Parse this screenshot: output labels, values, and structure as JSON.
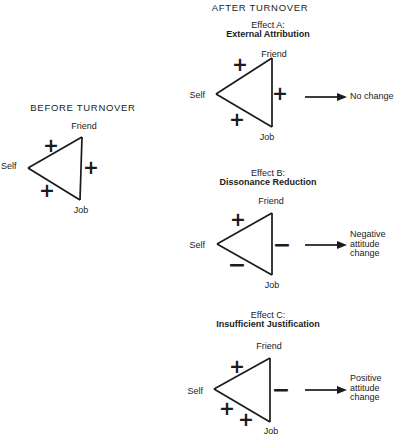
{
  "figure": {
    "before": {
      "title": "BEFORE TURNOVER",
      "nodes": {
        "left": "Self",
        "top": "Friend",
        "bottom": "Job"
      },
      "signs": {
        "self_friend": "+",
        "friend_job": "+",
        "self_job": "+"
      }
    },
    "after": {
      "title": "AFTER TURNOVER",
      "effects": [
        {
          "label": "Effect A:",
          "name": "External Attribution",
          "nodes": {
            "left": "Self",
            "top": "Friend",
            "bottom": "Job"
          },
          "signs": {
            "self_friend": "+",
            "friend_job": "+",
            "self_job": "+"
          },
          "outcome": "No change"
        },
        {
          "label": "Effect B:",
          "name": "Dissonance Reduction",
          "nodes": {
            "left": "Self",
            "top": "Friend",
            "bottom": "Job"
          },
          "signs": {
            "self_friend": "+",
            "friend_job": "−",
            "self_job": "−"
          },
          "outcome": "Negative\nattitude\nchange"
        },
        {
          "label": "Effect C:",
          "name": "Insufficient Justification",
          "nodes": {
            "left": "Self",
            "top": "Friend",
            "bottom": "Job"
          },
          "signs": {
            "self_friend": "+",
            "friend_job": "−",
            "self_job_a": "+",
            "self_job_b": "+"
          },
          "outcome": "Positive\nattitude\nchange"
        }
      ]
    }
  }
}
